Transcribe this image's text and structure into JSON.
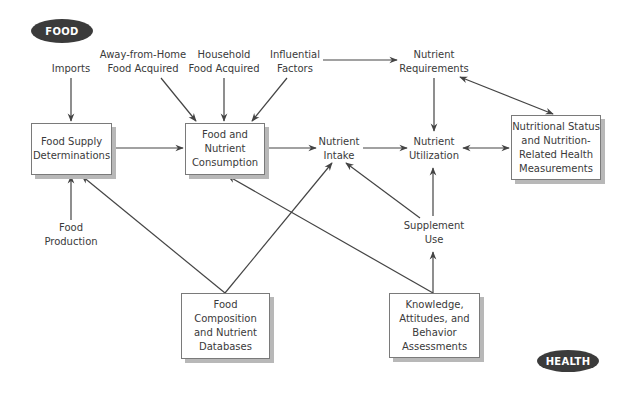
{
  "tags": {
    "food": "FOOD",
    "health": "HEALTH"
  },
  "labels": {
    "imports": "Imports",
    "away_from_home": "Away-from-Home\nFood Acquired",
    "household": "Household\nFood Acquired",
    "influential": "Influential\nFactors",
    "requirements": "Nutrient\nRequirements",
    "intake": "Nutrient\nIntake",
    "utilization": "Nutrient\nUtilization",
    "food_production": "Food\nProduction",
    "supplement": "Supplement\nUse"
  },
  "boxes": {
    "food_supply": "Food Supply\nDeterminations",
    "consumption": "Food and\nNutrient\nConsumption",
    "nutritional_status": "Nutritional Status\nand Nutrition-\nRelated Health\nMeasurements",
    "composition": "Food\nComposition\nand Nutrient\nDatabases",
    "knowledge": "Knowledge,\nAttitudes, and\nBehavior\nAssessments"
  },
  "colors": {
    "line": "#444444",
    "pill": "#3b3b3b",
    "shadow": "#b8b8b8"
  }
}
